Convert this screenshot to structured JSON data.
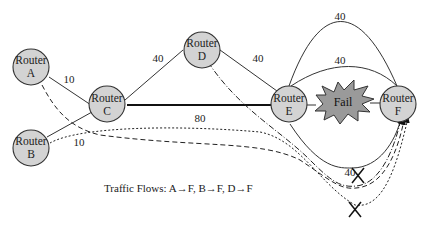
{
  "diagram": {
    "routers": [
      {
        "id": "A",
        "line1": "Router",
        "line2": "A"
      },
      {
        "id": "B",
        "line1": "Router",
        "line2": "B"
      },
      {
        "id": "C",
        "line1": "Router",
        "line2": "C"
      },
      {
        "id": "D",
        "line1": "Router",
        "line2": "D"
      },
      {
        "id": "E",
        "line1": "Router",
        "line2": "E"
      },
      {
        "id": "F",
        "line1": "Router",
        "line2": "F"
      }
    ],
    "links": [
      {
        "from": "A",
        "to": "C",
        "cost": "10"
      },
      {
        "from": "B",
        "to": "C",
        "cost": "10"
      },
      {
        "from": "C",
        "to": "D",
        "cost": "40"
      },
      {
        "from": "D",
        "to": "E",
        "cost": "40"
      },
      {
        "from": "C",
        "to": "E",
        "cost": "80"
      },
      {
        "from": "E",
        "to": "F",
        "cost": "40",
        "route": "upper-arc"
      },
      {
        "from": "E",
        "to": "F",
        "cost": "40",
        "route": "middle-arc"
      },
      {
        "from": "E",
        "to": "F",
        "cost": "40",
        "route": "lower-arc"
      }
    ],
    "failure_label": "Fail",
    "caption": "Traffic Flows: A→F, B→F, D→F",
    "colors": {
      "node_fill": "#d3d3d3",
      "fail_fill": "#9a9a9a",
      "line": "#333333"
    }
  }
}
